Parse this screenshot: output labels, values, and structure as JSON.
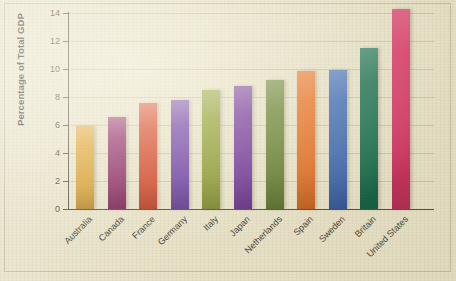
{
  "chart_data": {
    "type": "bar",
    "title": "",
    "subtitle": "",
    "xlabel": "",
    "ylabel": "Percentage of Total GDP",
    "categories": [
      "Australia",
      "Canada",
      "France",
      "Germany",
      "Italy",
      "Japan",
      "Netherlands",
      "Spain",
      "Sweden",
      "Britain",
      "United States"
    ],
    "values": [
      5.9,
      6.6,
      7.6,
      7.8,
      8.5,
      8.8,
      9.2,
      9.85,
      9.9,
      11.5,
      14.3
    ],
    "bar_colors": [
      "#e0a128",
      "#8e2063",
      "#d9401f",
      "#6a38a8",
      "#8d9c27",
      "#6c2a9b",
      "#5f7c25",
      "#ec6a17",
      "#3363b7",
      "#0e6b4a",
      "#da2b62"
    ],
    "ylim": [
      0,
      14
    ],
    "ytick_values": [
      0,
      2,
      4,
      6,
      8,
      10,
      12,
      14
    ],
    "ytick_labels": [
      "0",
      "2",
      "4",
      "6",
      "8",
      "10",
      "12",
      "14"
    ],
    "grid": true,
    "grid_axis": "y",
    "legend": false,
    "legend_position": "none",
    "xtick_label_rotation": -45,
    "background_color": "#e8e2c8",
    "axis_color": "#4d4835",
    "text_color": "#3a3628"
  }
}
